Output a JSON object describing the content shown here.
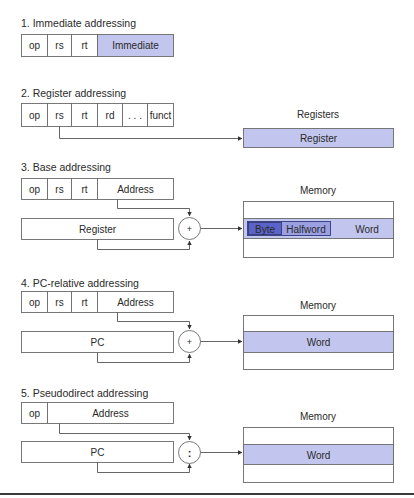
{
  "sections": [
    {
      "title": "1.  Immediate addressing",
      "fields": [
        "op",
        "rs",
        "rt",
        "Immediate"
      ]
    },
    {
      "title": "2. Register addressing",
      "fields": [
        "op",
        "rs",
        "rt",
        "rd",
        ". . .",
        "funct"
      ],
      "target_label": "Registers",
      "target_cell": "Register"
    },
    {
      "title": "3.  Base addressing",
      "fields": [
        "op",
        "rs",
        "rt",
        "Address"
      ],
      "source": "Register",
      "operator": "+",
      "target_label": "Memory",
      "target_cells": [
        "Byte",
        "Halfword",
        "Word"
      ]
    },
    {
      "title": "4.  PC-relative addressing",
      "fields": [
        "op",
        "rs",
        "rt",
        "Address"
      ],
      "source": "PC",
      "operator": "+",
      "target_label": "Memory",
      "target_cell": "Word"
    },
    {
      "title": "5.  Pseudodirect addressing",
      "fields": [
        "op",
        "Address"
      ],
      "source": "PC",
      "operator": ":",
      "target_label": "Memory",
      "target_cell": "Word"
    }
  ],
  "colors": {
    "highlight_fill": "#c2c6ee",
    "byte_fill": "#5b62c8",
    "halfword_fill": "#9aa0e2",
    "stroke": "#6b6b6b"
  }
}
